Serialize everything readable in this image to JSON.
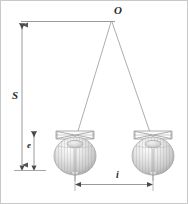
{
  "figure": {
    "background_color": "#ffffff",
    "border_color": "#c9c9c9",
    "line_color": "#8c8c8c",
    "label_color": "#2b2b2b"
  },
  "labels": {
    "apex": "O",
    "suspension_height": "S",
    "bob_offset": "e",
    "separation": "i"
  },
  "geometry": {
    "apex_point": {
      "x": 110,
      "y": 20
    },
    "top_reference_line": {
      "x1": 20,
      "y1": 20,
      "x2": 114,
      "y2": 20
    },
    "left_wire": {
      "x1": 110,
      "y1": 21,
      "x2": 74,
      "y2": 139
    },
    "right_wire": {
      "x1": 111,
      "y1": 21,
      "x2": 152,
      "y2": 139
    },
    "baseline": {
      "x1": 14,
      "y1": 168,
      "x2": 44,
      "y2": 168
    },
    "dim_S": {
      "x": 21,
      "y_top": 20,
      "y_bottom": 168,
      "arrows": "both"
    },
    "dim_e": {
      "x": 33,
      "y_top": 130,
      "y_bottom": 168,
      "arrows": "both"
    },
    "dim_i": {
      "y": 183,
      "x_left": 74,
      "x_right": 152,
      "arrows": "both"
    }
  },
  "bobs": [
    {
      "name": "left-bob",
      "cx": 74,
      "cy": 155,
      "rx": 21,
      "ry": 19,
      "clamp_y": 134,
      "clamp_half_width": 19
    },
    {
      "name": "right-bob",
      "cx": 152,
      "cy": 155,
      "rx": 21,
      "ry": 19,
      "clamp_y": 134,
      "clamp_half_width": 19
    }
  ],
  "style_values": {
    "wire_width": "0.7",
    "dim_line_width": "0.9",
    "bob_stripe_color": "#b6b6b6",
    "bob_fill_light": "#fbfbfb",
    "bob_fill_mid": "#d8d8d8",
    "bob_fill_dark": "#b0b0b0"
  }
}
